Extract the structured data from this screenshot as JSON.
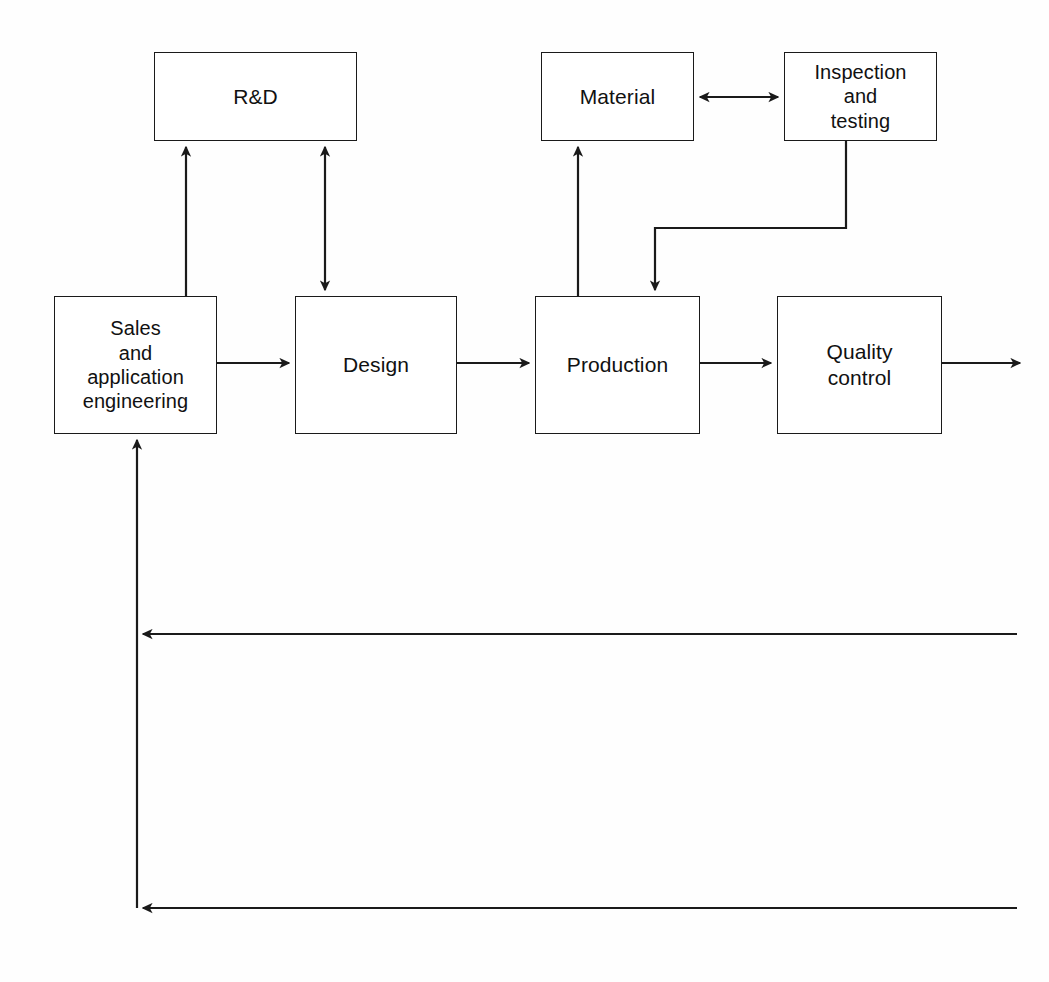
{
  "diagram": {
    "background_color": "#fefefe",
    "line_color": "#1a1a1a",
    "text_color": "#111111",
    "width": 1049,
    "height": 982,
    "nodes": [
      {
        "id": "rd",
        "label": "R&D",
        "x": 154,
        "y": 52,
        "w": 203,
        "h": 89
      },
      {
        "id": "material",
        "label": "Material",
        "x": 541,
        "y": 52,
        "w": 153,
        "h": 89
      },
      {
        "id": "inspection",
        "label": "Inspection\nand\ntesting",
        "x": 784,
        "y": 52,
        "w": 153,
        "h": 89
      },
      {
        "id": "sales",
        "label": "Sales\nand\napplication\nengineering",
        "x": 54,
        "y": 296,
        "w": 163,
        "h": 138
      },
      {
        "id": "design",
        "label": "Design",
        "x": 295,
        "y": 296,
        "w": 162,
        "h": 138
      },
      {
        "id": "production",
        "label": "Production",
        "x": 535,
        "y": 296,
        "w": 165,
        "h": 138
      },
      {
        "id": "quality",
        "label": "Quality\ncontrol",
        "x": 777,
        "y": 296,
        "w": 165,
        "h": 138
      }
    ],
    "connectors": [
      {
        "id": "sales-to-rd",
        "from": "sales",
        "to": "rd",
        "style": "single-arrow",
        "direction": "up"
      },
      {
        "id": "rd-design-bidirectional",
        "from": "rd",
        "to": "design",
        "style": "double-arrow",
        "direction": "vertical"
      },
      {
        "id": "sales-to-design",
        "from": "sales",
        "to": "design",
        "style": "single-arrow",
        "direction": "right"
      },
      {
        "id": "design-to-production",
        "from": "design",
        "to": "production",
        "style": "single-arrow",
        "direction": "right"
      },
      {
        "id": "production-to-quality",
        "from": "production",
        "to": "quality",
        "style": "single-arrow",
        "direction": "right"
      },
      {
        "id": "quality-output",
        "from": "quality",
        "to": "output",
        "style": "single-arrow",
        "direction": "right"
      },
      {
        "id": "production-to-material",
        "from": "production",
        "to": "material",
        "style": "single-arrow",
        "direction": "up"
      },
      {
        "id": "material-inspection",
        "from": "material",
        "to": "inspection",
        "style": "double-arrow",
        "direction": "horizontal"
      },
      {
        "id": "inspection-to-production",
        "from": "inspection",
        "to": "production",
        "style": "single-arrow",
        "direction": "down"
      },
      {
        "id": "feedback-upper",
        "from": "right-edge",
        "to": "sales",
        "style": "single-arrow",
        "direction": "left"
      },
      {
        "id": "feedback-lower",
        "from": "right-edge",
        "to": "sales",
        "style": "single-arrow",
        "direction": "left"
      }
    ]
  }
}
